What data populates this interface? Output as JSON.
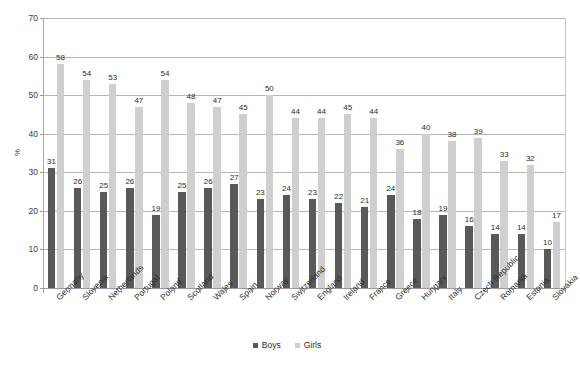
{
  "chart_data": {
    "type": "bar",
    "title": "",
    "xlabel": "",
    "ylabel": "%",
    "ylim": [
      0,
      70
    ],
    "ytick_step": 10,
    "yticks": [
      0,
      10,
      20,
      30,
      40,
      50,
      60,
      70
    ],
    "grid": true,
    "legend_position": "bottom-center",
    "categories": [
      "Germany",
      "Slovenia",
      "Netherlands",
      "Portugal",
      "Poland",
      "Scotland",
      "Wales",
      "Spain",
      "Norway",
      "Switzerland",
      "England",
      "Ireland",
      "France",
      "Greece",
      "Hungary",
      "Italy",
      "Czech Republic",
      "Romania",
      "Estonia",
      "Slovakia"
    ],
    "series": [
      {
        "name": "Boys",
        "color": "#595959",
        "values": [
          31,
          26,
          25,
          26,
          19,
          25,
          26,
          27,
          23,
          24,
          23,
          22,
          21,
          24,
          18,
          19,
          16,
          14,
          14,
          10
        ]
      },
      {
        "name": "Girls",
        "color": "#cfcfcf",
        "values": [
          58,
          54,
          53,
          47,
          54,
          48,
          47,
          45,
          50,
          44,
          44,
          45,
          44,
          36,
          40,
          38,
          39,
          33,
          32,
          17
        ]
      }
    ]
  },
  "legend": {
    "items": [
      {
        "label": "Boys",
        "color": "#595959"
      },
      {
        "label": "Girls",
        "color": "#cfcfcf"
      }
    ]
  },
  "axis": {
    "y_title": "%"
  }
}
